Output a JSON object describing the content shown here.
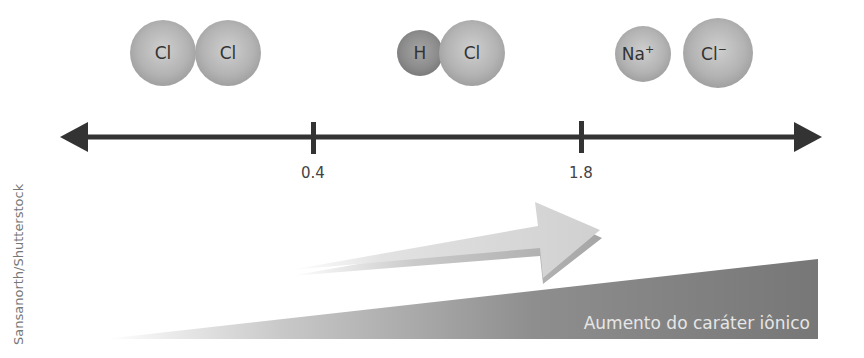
{
  "credit": "Sansanorth/Shutterstock",
  "molecules": [
    {
      "name": "Cl2",
      "atoms": [
        {
          "symbol": "Cl"
        },
        {
          "symbol": "Cl"
        }
      ]
    },
    {
      "name": "HCl",
      "atoms": [
        {
          "symbol": "H"
        },
        {
          "symbol": "Cl"
        }
      ]
    },
    {
      "name": "NaCl",
      "atoms": [
        {
          "symbol": "Na",
          "charge": "+"
        },
        {
          "symbol": "Cl",
          "charge": "−"
        }
      ]
    }
  ],
  "axis": {
    "ticks": [
      {
        "label": "0.4"
      },
      {
        "label": "1.8"
      }
    ]
  },
  "trend": {
    "label": "Aumento do caráter iônico"
  },
  "colors": {
    "axis": "#333333",
    "atom": "#b5b5b5",
    "atom_h": "#8f8f8f",
    "wedge": "#7a7a7a",
    "arrow": "#d4d4d4"
  }
}
